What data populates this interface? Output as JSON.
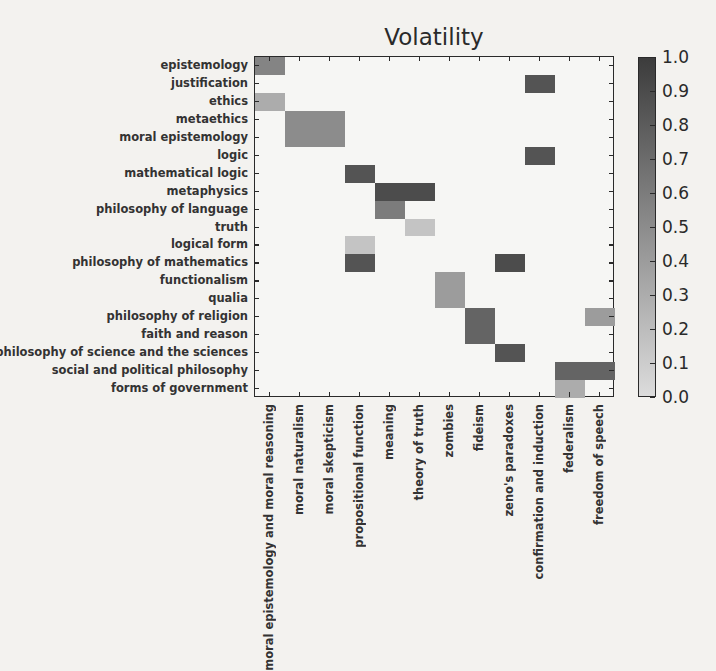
{
  "chart_data": {
    "type": "heatmap",
    "title": "Volatility",
    "xlabel": "",
    "ylabel": "",
    "rows": [
      "epistemology",
      "justification",
      "ethics",
      "metaethics",
      "moral epistemology",
      "logic",
      "mathematical logic",
      "metaphysics",
      "philosophy of language",
      "truth",
      "logical form",
      "philosophy of mathematics",
      "functionalism",
      "qualia",
      "philosophy of religion",
      "faith and reason",
      "philosophy of science and the sciences",
      "social and political philosophy",
      "forms of government"
    ],
    "columns": [
      "moral epistemology and moral reasoning",
      "moral naturalism",
      "moral skepticism",
      "propositional function",
      "meaning",
      "theory of truth",
      "zombies",
      "fideism",
      "zeno's paradoxes",
      "confirmation and induction",
      "federalism",
      "freedom of speech"
    ],
    "values": [
      [
        0.55,
        0,
        0,
        0,
        0,
        0,
        0,
        0,
        0,
        0,
        0,
        0
      ],
      [
        0,
        0,
        0,
        0,
        0,
        0,
        0,
        0,
        0,
        0.85,
        0,
        0
      ],
      [
        0.3,
        0,
        0,
        0,
        0,
        0,
        0,
        0,
        0,
        0,
        0,
        0
      ],
      [
        0,
        0.5,
        0.5,
        0,
        0,
        0,
        0,
        0,
        0,
        0,
        0,
        0
      ],
      [
        0,
        0.5,
        0.5,
        0,
        0,
        0,
        0,
        0,
        0,
        0,
        0,
        0
      ],
      [
        0,
        0,
        0,
        0,
        0,
        0,
        0,
        0,
        0,
        0.85,
        0,
        0
      ],
      [
        0,
        0,
        0,
        0.85,
        0,
        0,
        0,
        0,
        0,
        0,
        0,
        0
      ],
      [
        0,
        0,
        0,
        0,
        0.9,
        0.9,
        0,
        0,
        0,
        0,
        0,
        0
      ],
      [
        0,
        0,
        0,
        0,
        0.6,
        0,
        0,
        0,
        0,
        0,
        0,
        0
      ],
      [
        0,
        0,
        0,
        0,
        0,
        0.15,
        0,
        0,
        0,
        0,
        0,
        0
      ],
      [
        0,
        0,
        0,
        0.15,
        0,
        0,
        0,
        0,
        0,
        0,
        0,
        0
      ],
      [
        0,
        0,
        0,
        0.85,
        0,
        0,
        0,
        0,
        0.9,
        0,
        0,
        0
      ],
      [
        0,
        0,
        0,
        0,
        0,
        0,
        0.4,
        0,
        0,
        0,
        0,
        0
      ],
      [
        0,
        0,
        0,
        0,
        0,
        0,
        0.4,
        0,
        0,
        0,
        0,
        0
      ],
      [
        0,
        0,
        0,
        0,
        0,
        0,
        0,
        0.75,
        0,
        0,
        0,
        0.4
      ],
      [
        0,
        0,
        0,
        0,
        0,
        0,
        0,
        0.75,
        0,
        0,
        0,
        0
      ],
      [
        0,
        0,
        0,
        0,
        0,
        0,
        0,
        0,
        0.85,
        0,
        0,
        0
      ],
      [
        0,
        0,
        0,
        0,
        0,
        0,
        0,
        0,
        0,
        0,
        0.75,
        0.75
      ],
      [
        0,
        0,
        0,
        0,
        0,
        0,
        0,
        0,
        0,
        0,
        0.3,
        0
      ]
    ],
    "colorbar": {
      "min": 0.0,
      "max": 1.0,
      "ticks": [
        "0.0",
        "0.1",
        "0.2",
        "0.3",
        "0.4",
        "0.5",
        "0.6",
        "0.7",
        "0.8",
        "0.9",
        "1.0"
      ],
      "colormap": "greys",
      "low_color": "#dcdcdc",
      "high_color": "#3c3c3c"
    },
    "grid": false,
    "legend_position": "right (colorbar)"
  }
}
